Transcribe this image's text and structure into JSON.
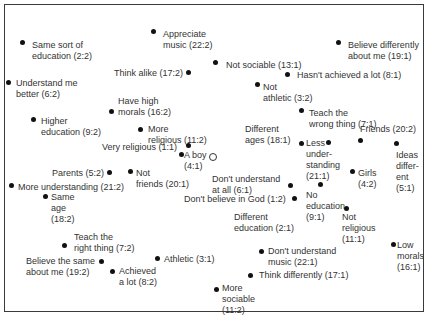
{
  "diagram": {
    "type": "similarity-map",
    "origin_marker": "O",
    "items": [
      {
        "text": "Same sort of\neducation (2:2)",
        "x": 32,
        "y": 40,
        "dx": 22,
        "dy": 42
      },
      {
        "text": "Appreciate\nmusic (22:2)",
        "x": 163,
        "y": 29,
        "dx": 153,
        "dy": 31
      },
      {
        "text": "Believe differently\nabout me (19:1)",
        "x": 348,
        "y": 40,
        "dx": 338,
        "dy": 42
      },
      {
        "text": "Not sociable (13:1)",
        "x": 226,
        "y": 60,
        "dx": 215,
        "dy": 62
      },
      {
        "text": "Think alike (17:2)",
        "x": 114,
        "y": 68,
        "dx": 188,
        "dy": 72
      },
      {
        "text": "Hasn't achieved a lot (8:1)",
        "x": 297,
        "y": 70,
        "dx": 287,
        "dy": 74
      },
      {
        "text": "Understand me\nbetter (6:2)",
        "x": 16,
        "y": 78,
        "dx": 8,
        "dy": 82
      },
      {
        "text": "Not\nathletic (3:2)",
        "x": 263,
        "y": 82,
        "dx": 257,
        "dy": 84
      },
      {
        "text": "Have high\nmorals (16:2)",
        "x": 118,
        "y": 96,
        "dx": 111,
        "dy": 111
      },
      {
        "text": "Teach the\nwrong thing (7:1)",
        "x": 309,
        "y": 108,
        "dx": 301,
        "dy": 110
      },
      {
        "text": "Higher\neducation (9:2)",
        "x": 41,
        "y": 116,
        "dx": 33,
        "dy": 119
      },
      {
        "text": "More\nreligious (11:2)",
        "x": 148,
        "y": 124,
        "dx": 140,
        "dy": 129
      },
      {
        "text": "Different\nages (18:1)",
        "x": 245,
        "y": 124,
        "dx": 301,
        "dy": 143
      },
      {
        "text": "Friends (20:2)",
        "x": 360,
        "y": 124,
        "dx": 360,
        "dy": 140
      },
      {
        "text": "Less\nunder-\nstanding\n(21:1)",
        "x": 306,
        "y": 138,
        "dx": 328,
        "dy": 142
      },
      {
        "text": "Very religious (1:1)",
        "x": 102,
        "y": 142,
        "dx": 188,
        "dy": 145
      },
      {
        "text": "Ideas\ndiffer-\nent\n(5:1)",
        "x": 396,
        "y": 150,
        "dx": 396,
        "dy": 143
      },
      {
        "text": "A boy\n(4:1)",
        "x": 184,
        "y": 150,
        "dx": 181,
        "dy": 154
      },
      {
        "text": "Parents (5:2)",
        "x": 52,
        "y": 168,
        "dx": 109,
        "dy": 172
      },
      {
        "text": "Not\nfriends (20:1)",
        "x": 136,
        "y": 168,
        "dx": 130,
        "dy": 171
      },
      {
        "text": "Girls\n(4:2)",
        "x": 358,
        "y": 168,
        "dx": 352,
        "dy": 171
      },
      {
        "text": "Don't understand\nat all (6:1)",
        "x": 212,
        "y": 174,
        "dx": 290,
        "dy": 185
      },
      {
        "text": "No\neducation\n(9:1)",
        "x": 306,
        "y": 190,
        "dx": 320,
        "dy": 184
      },
      {
        "text": "More understanding (21:2)",
        "x": 18,
        "y": 182,
        "dx": 11,
        "dy": 185
      },
      {
        "text": "Same\nage\n(18:2)",
        "x": 51,
        "y": 192,
        "dx": 45,
        "dy": 196
      },
      {
        "text": "Don't believe in God (1:2)",
        "x": 184,
        "y": 194,
        "dx": 294,
        "dy": 198
      },
      {
        "text": "Different\neducation (2:1)",
        "x": 234,
        "y": 212,
        "dx": 0,
        "dy": 0
      },
      {
        "text": "Not\nreligious\n(11:1)",
        "x": 342,
        "y": 212,
        "dx": 346,
        "dy": 208
      },
      {
        "text": "Teach the\nright thing (7:2)",
        "x": 74,
        "y": 232,
        "dx": 64,
        "dy": 245
      },
      {
        "text": "Athletic (3:1)",
        "x": 164,
        "y": 254,
        "dx": 157,
        "dy": 258
      },
      {
        "text": "Believe the same\nabout me (19:2)",
        "x": 26,
        "y": 256,
        "dx": 101,
        "dy": 261
      },
      {
        "text": "Achieved\na lot (8:2)",
        "x": 119,
        "y": 266,
        "dx": 112,
        "dy": 271
      },
      {
        "text": "Don't understand\nmusic (22:1)",
        "x": 268,
        "y": 246,
        "dx": 261,
        "dy": 251
      },
      {
        "text": "Low\nmorals\n(16:1)",
        "x": 397,
        "y": 240,
        "dx": 393,
        "dy": 244
      },
      {
        "text": "Think differently (17:1)",
        "x": 259,
        "y": 270,
        "dx": 250,
        "dy": 275
      },
      {
        "text": "More\nsociable\n(11:2)",
        "x": 222,
        "y": 283,
        "dx": 216,
        "dy": 289
      }
    ],
    "origin": {
      "x": 212,
      "y": 156
    }
  }
}
